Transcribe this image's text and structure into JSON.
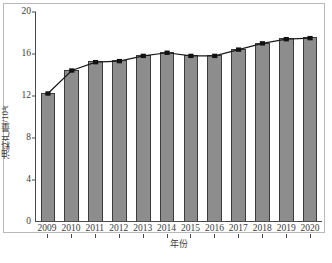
{
  "chart_data": {
    "type": "bar",
    "title": "",
    "subtitle": "",
    "xlabel": "年份",
    "ylabel": "油料产量/10⁴t",
    "categories": [
      "2009",
      "2010",
      "2011",
      "2012",
      "2013",
      "2014",
      "2015",
      "2016",
      "2017",
      "2018",
      "2019",
      "2020"
    ],
    "series": [
      {
        "name": "油料产量",
        "type": "bar",
        "values": [
          12.2,
          14.4,
          15.2,
          15.3,
          15.8,
          16.1,
          15.8,
          15.8,
          16.4,
          17.0,
          17.4,
          17.5
        ]
      },
      {
        "name": "趋势线",
        "type": "line",
        "values": [
          12.2,
          14.4,
          15.2,
          15.3,
          15.8,
          16.1,
          15.8,
          15.8,
          16.4,
          17.0,
          17.4,
          17.5
        ]
      }
    ],
    "ylim": [
      0,
      20
    ],
    "yticks": [
      "0",
      "4",
      "8",
      "12",
      "16",
      "20"
    ],
    "ytick_values": [
      0,
      4,
      8,
      12,
      16,
      20
    ],
    "xlim_categories": 12,
    "grid": false,
    "legend": "none",
    "colors": {
      "bar_fill": "#8d8d8d",
      "bar_edge": "#3c3c3c",
      "line": "#1a1a1a",
      "marker": "#111111",
      "axis": "#4a4a4a",
      "frame": "#b9b9b9",
      "text": "#3a3a3a",
      "background": "#ffffff"
    }
  }
}
